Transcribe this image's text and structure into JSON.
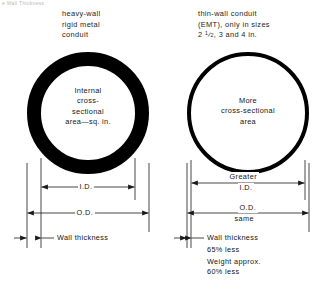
{
  "diagram": {
    "top_fragment": "e Wall Thickness",
    "left": {
      "heading_lines": [
        "heavy-wall",
        "rigid metal",
        "conduit"
      ],
      "circle_text_lines": [
        "Internal",
        "cross-",
        "sectional",
        "area—sq. in."
      ],
      "dimensions": {
        "inner_diameter": "I.D.",
        "outer_diameter": "O.D.",
        "wall_thickness": "Wall thickness"
      },
      "ring": {
        "type": "thick-wall",
        "outer_diameter_px": 122,
        "wall_thickness_px": 14,
        "color": "#000000"
      }
    },
    "right": {
      "heading_lines": [
        "thin-wall conduit",
        "(EMT), only in sizes",
        "2 ½, 3 and 4 in."
      ],
      "heading_size_numerator": "1",
      "heading_size_denominator": "2",
      "circle_text_lines": [
        "More",
        "cross-sectional",
        "area"
      ],
      "dimensions": {
        "inner_diameter_line1": "Greater",
        "inner_diameter_line2": "I.D.",
        "outer_diameter_line1": "O.D.",
        "outer_diameter_line2": "same",
        "wall_thickness": "Wall thickness"
      },
      "notes": [
        "65% less",
        "Weight approx.",
        "60% less"
      ],
      "ring": {
        "type": "thin-wall",
        "outer_diameter_px": 122,
        "wall_thickness_px": 4,
        "color": "#000000"
      }
    },
    "style": {
      "line_color": "#1a1a1a",
      "background": "#ffffff",
      "ink": "#000000"
    }
  }
}
